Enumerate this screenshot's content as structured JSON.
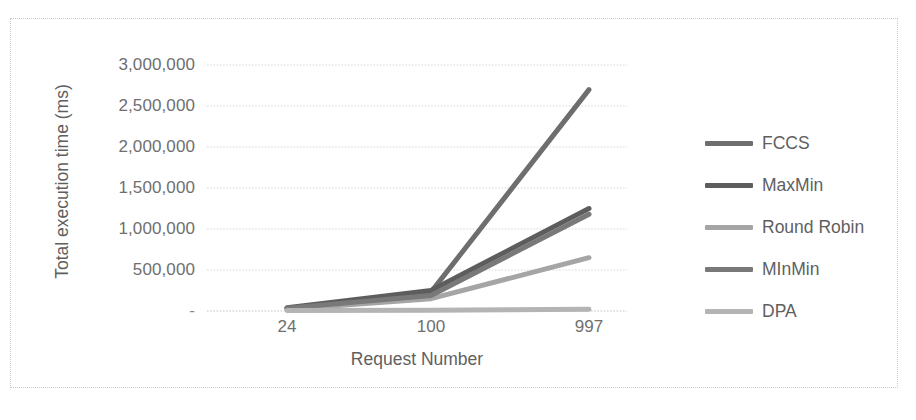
{
  "chart_data": {
    "type": "line",
    "title": "",
    "xlabel": "Request Number",
    "ylabel": "Total execution time (ms)",
    "categories": [
      "24",
      "100",
      "997"
    ],
    "x": [
      24,
      100,
      997
    ],
    "ylim": [
      0,
      3000000
    ],
    "ytick_values": [
      3000000,
      2500000,
      2000000,
      1500000,
      1000000,
      500000,
      0
    ],
    "ytick_labels": [
      "3,000,000",
      "2,500,000",
      "2,000,000",
      "1,500,000",
      "1,000,000",
      "500,000",
      "-"
    ],
    "grid": "horizontal-dotted",
    "legend_position": "right",
    "series": [
      {
        "name": "FCCS",
        "values": [
          30000,
          230000,
          2700000
        ],
        "color": "#6e6e6e"
      },
      {
        "name": "MaxMin",
        "values": [
          40000,
          250000,
          1250000
        ],
        "color": "#5d5d5d"
      },
      {
        "name": "Round Robin",
        "values": [
          20000,
          150000,
          650000
        ],
        "color": "#a5a5a5"
      },
      {
        "name": "MInMin",
        "values": [
          35000,
          190000,
          1180000
        ],
        "color": "#797979"
      },
      {
        "name": "DPA",
        "values": [
          5000,
          10000,
          20000
        ],
        "color": "#b4b4b4"
      }
    ]
  },
  "axes": {
    "y_title": "Total execution time (ms)",
    "x_title": "Request Number",
    "y_labels": [
      "3,000,000",
      "2,500,000",
      "2,000,000",
      "1,500,000",
      "1,000,000",
      "500,000",
      "-"
    ],
    "x_labels": [
      "24",
      "100",
      "997"
    ]
  },
  "legend": {
    "items": [
      {
        "label": "FCCS"
      },
      {
        "label": "MaxMin"
      },
      {
        "label": "Round Robin"
      },
      {
        "label": "MInMin"
      },
      {
        "label": "DPA"
      }
    ]
  },
  "style": {
    "background": "#ffffff",
    "frame_border": "#c9c9c9",
    "gridline": "#d7d7d7",
    "text": "#6f6f6f"
  }
}
